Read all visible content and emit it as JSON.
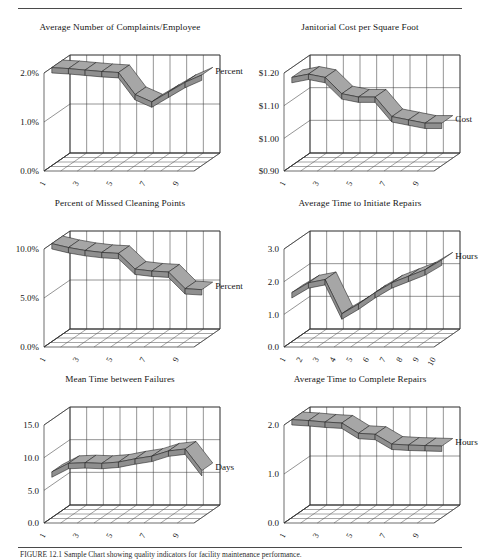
{
  "page": {
    "caption": "FIGURE 12.1  Sample Chart showing quality indicators for facility maintenance performance."
  },
  "charts": [
    {
      "id": "complaints",
      "series_label": "Percent",
      "chart_data": {
        "type": "area",
        "title": "Average Number of Complaints/Employee",
        "xlabel": "",
        "ylabel": "Percent",
        "ylim": [
          0.0,
          2.0
        ],
        "yticks": [
          "0.0%",
          "1.0%",
          "2.0%"
        ],
        "ytick_values": [
          0.0,
          1.0,
          2.0
        ],
        "categories": [
          "1",
          "2",
          "3",
          "4",
          "5",
          "6",
          "7",
          "8",
          "9",
          "10"
        ],
        "xtick_labels": [
          "1",
          "3",
          "5",
          "7",
          "9"
        ],
        "values": [
          2.0,
          1.98,
          1.95,
          1.92,
          1.9,
          1.45,
          1.3,
          1.5,
          1.7,
          1.85
        ],
        "grid": true,
        "legend": "right"
      }
    },
    {
      "id": "janitorial-cost",
      "series_label": "Cost",
      "chart_data": {
        "type": "area",
        "title": "Janitorial Cost per Square Foot",
        "xlabel": "",
        "ylabel": "Cost",
        "ylim": [
          0.9,
          1.2
        ],
        "yticks": [
          "$0.90",
          "$1.00",
          "$1.10",
          "$1.20"
        ],
        "ytick_values": [
          0.9,
          1.0,
          1.1,
          1.2
        ],
        "categories": [
          "1",
          "2",
          "3",
          "4",
          "5",
          "6",
          "7",
          "8",
          "9",
          "10"
        ],
        "xtick_labels": [
          "1",
          "3",
          "5",
          "7",
          "9"
        ],
        "values": [
          1.17,
          1.18,
          1.17,
          1.12,
          1.11,
          1.11,
          1.05,
          1.04,
          1.03,
          1.03
        ],
        "grid": true,
        "legend": "right"
      }
    },
    {
      "id": "missed-cleaning-points",
      "series_label": "Percent",
      "chart_data": {
        "type": "area",
        "title": "Percent of Missed Cleaning Points",
        "xlabel": "",
        "ylabel": "Percent",
        "ylim": [
          0.0,
          10.0
        ],
        "yticks": [
          "0.0%",
          "5.0%",
          "10.0%"
        ],
        "ytick_values": [
          0.0,
          5.0,
          10.0
        ],
        "categories": [
          "1",
          "2",
          "3",
          "4",
          "5",
          "6",
          "7",
          "8",
          "9",
          "10"
        ],
        "xtick_labels": [
          "1",
          "3",
          "5",
          "7",
          "9"
        ],
        "values": [
          10.0,
          9.6,
          9.3,
          9.1,
          9.0,
          7.4,
          7.2,
          7.1,
          5.4,
          5.3
        ],
        "grid": true,
        "legend": "right"
      }
    },
    {
      "id": "time-to-initiate-repairs",
      "series_label": "Hours",
      "chart_data": {
        "type": "area",
        "title": "Average Time to Initiate Repairs",
        "xlabel": "",
        "ylabel": "Hours",
        "ylim": [
          0.0,
          3.0
        ],
        "yticks": [
          "0.0",
          "1.0",
          "2.0",
          "3.0"
        ],
        "ytick_values": [
          0.0,
          1.0,
          2.0,
          3.0
        ],
        "categories": [
          "1",
          "2",
          "3",
          "4",
          "5",
          "6",
          "7",
          "8",
          "9",
          "10"
        ],
        "xtick_labels": [
          "1",
          "2",
          "3",
          "4",
          "5",
          "6",
          "7",
          "8",
          "9",
          "10"
        ],
        "values": [
          1.5,
          1.8,
          1.9,
          0.85,
          1.15,
          1.5,
          1.8,
          2.0,
          2.2,
          2.5
        ],
        "grid": true,
        "legend": "right"
      }
    },
    {
      "id": "mean-time-between-failures",
      "series_label": "Days",
      "chart_data": {
        "type": "area",
        "title": "Mean Time between Failures",
        "xlabel": "",
        "ylabel": "Days",
        "ylim": [
          0.0,
          15.0
        ],
        "yticks": [
          "0.0",
          "5.0",
          "10.0",
          "15.0"
        ],
        "ytick_values": [
          0.0,
          5.0,
          10.0,
          15.0
        ],
        "categories": [
          "1",
          "2",
          "3",
          "4",
          "5",
          "6",
          "7",
          "8",
          "9",
          "10"
        ],
        "xtick_labels": [
          "1",
          "3",
          "5",
          "7",
          "9"
        ],
        "values": [
          7.0,
          8.3,
          8.4,
          8.3,
          8.5,
          9.0,
          9.4,
          10.2,
          10.5,
          7.2
        ],
        "grid": true,
        "legend": "right"
      }
    },
    {
      "id": "time-to-complete-repairs",
      "series_label": "Hours",
      "chart_data": {
        "type": "area",
        "title": "Average Time to Complete Repairs",
        "xlabel": "",
        "ylabel": "Hours",
        "ylim": [
          0.0,
          2.0
        ],
        "yticks": [
          "0.0",
          "1.0",
          "2.0"
        ],
        "ytick_values": [
          0.0,
          1.0,
          2.0
        ],
        "categories": [
          "1",
          "2",
          "3",
          "4",
          "5",
          "6",
          "7",
          "8",
          "9",
          "10"
        ],
        "xtick_labels": [
          "1",
          "3",
          "5",
          "7",
          "9"
        ],
        "values": [
          2.0,
          1.98,
          1.95,
          1.93,
          1.72,
          1.7,
          1.5,
          1.48,
          1.47,
          1.46
        ],
        "grid": true,
        "legend": "right"
      }
    }
  ]
}
